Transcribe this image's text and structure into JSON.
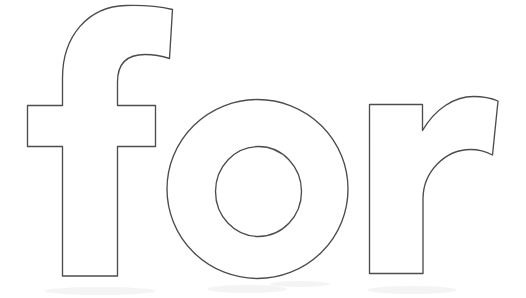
{
  "page": {
    "title": "for",
    "kind": "coloring-page-word-outline",
    "background_color": "#ffffff",
    "outline_color": "#4d4d4d",
    "fill_color": "#ffffff",
    "width": 526,
    "height": 298
  },
  "word": {
    "text": "for",
    "case": "lowercase",
    "style": "bold sans-serif outline",
    "letters": [
      {
        "id": "letter-f",
        "char": "f",
        "label": "letter f outline",
        "has_counter": false,
        "bbox": {
          "x": 27,
          "y": 5,
          "width": 146,
          "height": 271
        },
        "outline_path": "M 62.5 276 L 62.5 146.5 L 27.5 146.5 L 27.5 105.5 L 62.5 105.5 L 62.5 78 C 62.5 36 88 6.5 126 5.5 C 145 5 160 6.5 172.5 9.5 L 169.5 58.5 C 162 56 153 54.5 145 54.5 C 128 54.5 117.5 63 117.5 82 L 117.5 105.5 L 155.5 105.5 L 155.5 146.5 L 117.5 146.5 L 117.5 276 Z"
      },
      {
        "id": "letter-o",
        "char": "o",
        "label": "letter o outline",
        "has_counter": true,
        "bbox": {
          "x": 167,
          "y": 99,
          "width": 181,
          "height": 180
        },
        "outer": {
          "cx": 257.5,
          "cy": 189,
          "rx": 90.5,
          "ry": 89.5
        },
        "counter": {
          "cx": 258.5,
          "cy": 191.5,
          "rx": 43,
          "ry": 45
        }
      },
      {
        "id": "letter-r",
        "char": "r",
        "label": "letter r outline",
        "has_counter": false,
        "bbox": {
          "x": 369,
          "y": 96,
          "width": 130,
          "height": 178
        },
        "outline_path": "M 369.5 273.5 L 369.5 104.5 L 422.5 104.5 L 422.5 130.5 C 435 109 454 96.5 473.5 96.5 C 483 96.5 491 98 498 101 L 492.5 155 C 486 151.5 478.5 149.5 470.5 149.5 C 446 149.5 423 171 423 199 L 423 273.5 Z",
        "arm_outer_curve": "from stem top-right (422.5,130.5) arcing up over peak near (468,98) to right terminal (498,101)",
        "arm_inner_curve": "from right terminal (492.5,155) arcing left over peak near (462,148) down to stem inner (423,199)"
      }
    ]
  },
  "artifacts": {
    "description": "faint scanner ghost smudges near lower edge",
    "visible": true
  }
}
